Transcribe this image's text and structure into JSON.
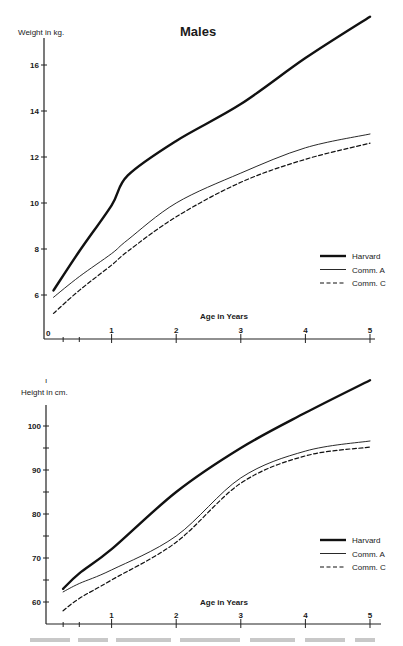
{
  "page": {
    "title": "Males"
  },
  "chart_data": [
    {
      "type": "line",
      "title": "Males",
      "xlabel": "Age in Years",
      "ylabel": "Weight in kg.",
      "xlim": [
        0,
        5
      ],
      "ylim": [
        4.4,
        17.6
      ],
      "x_ticks": [
        "0",
        "1",
        "2",
        "3",
        "4",
        "5"
      ],
      "y_ticks": [
        "6",
        "8",
        "10",
        "12",
        "14",
        "16"
      ],
      "legend": [
        "Harvard",
        "Comm. A",
        "Comm. C"
      ],
      "legend_position": "lower right",
      "grid": false,
      "x": [
        0.1,
        0.5,
        1,
        1.25,
        2,
        3,
        4,
        5
      ],
      "series": [
        {
          "name": "Harvard",
          "style": "thick-solid",
          "values": [
            6.2,
            7.9,
            9.9,
            11.2,
            12.7,
            14.3,
            16.3,
            18.1
          ]
        },
        {
          "name": "Comm. A",
          "style": "thin-solid",
          "values": [
            5.9,
            6.8,
            7.8,
            8.4,
            10.0,
            11.3,
            12.4,
            13.0
          ]
        },
        {
          "name": "Comm. C",
          "style": "dashed",
          "values": [
            5.2,
            6.2,
            7.3,
            7.9,
            9.4,
            10.9,
            11.9,
            12.6
          ]
        }
      ]
    },
    {
      "type": "line",
      "title": "",
      "xlabel": "Age in Years",
      "ylabel": "Height in cm.",
      "xlim": [
        0,
        5
      ],
      "ylim": [
        55,
        105
      ],
      "x_ticks": [
        "1",
        "2",
        "3",
        "4",
        "5"
      ],
      "y_ticks": [
        "60",
        "70",
        "80",
        "90",
        "100"
      ],
      "legend": [
        "Harvard",
        "Comm. A",
        "Comm. C"
      ],
      "legend_position": "lower right",
      "grid": false,
      "x": [
        0.25,
        0.5,
        1,
        2,
        3,
        4,
        5
      ],
      "series": [
        {
          "name": "Harvard",
          "style": "thick-solid",
          "values": [
            63.0,
            66.5,
            72.0,
            85.0,
            95.0,
            103.0,
            110.4
          ]
        },
        {
          "name": "Comm. A",
          "style": "thin-solid",
          "values": [
            62.3,
            64.2,
            67.3,
            75.0,
            88.2,
            94.3,
            96.6
          ]
        },
        {
          "name": "Comm. C",
          "style": "dashed",
          "values": [
            58.0,
            60.8,
            65.0,
            73.6,
            87.0,
            93.2,
            95.2
          ]
        }
      ]
    }
  ]
}
